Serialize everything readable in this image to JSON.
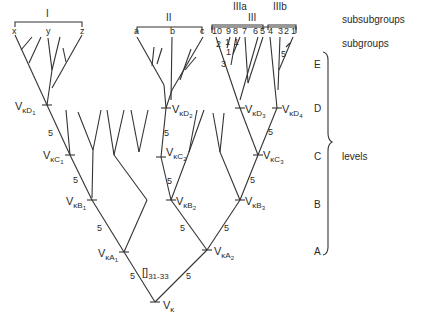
{
  "legend": {
    "subsubgroups": "subsubgroups",
    "subgroups": "subgroups",
    "levels": "levels"
  },
  "groups": {
    "I": "I",
    "II": "II",
    "III": "III",
    "IIIa": "IIIa",
    "IIIb": "IIIb"
  },
  "leaves": {
    "x": "x",
    "y": "y",
    "z": "z",
    "a": "a",
    "b": "b",
    "c": "c",
    "n10": "10",
    "n9": "9",
    "n8": "8",
    "n7": "7",
    "n6": "6",
    "n5": "5",
    "n4": "4",
    "n3": "3",
    "n2": "2",
    "n1": "1"
  },
  "level_labels": [
    "E",
    "D",
    "C",
    "B",
    "A"
  ],
  "nodes": {
    "root": {
      "main": "V",
      "sub": "κ",
      "subsub": ""
    },
    "A1": {
      "main": "V",
      "sub": "κA",
      "subsub": "1"
    },
    "A2": {
      "main": "V",
      "sub": "κA",
      "subsub": "2"
    },
    "B1": {
      "main": "V",
      "sub": "κB",
      "subsub": "1"
    },
    "B2": {
      "main": "V",
      "sub": "κB",
      "subsub": "2"
    },
    "B3": {
      "main": "V",
      "sub": "κB",
      "subsub": "3"
    },
    "C1": {
      "main": "V",
      "sub": "κC",
      "subsub": "1"
    },
    "C2": {
      "main": "V",
      "sub": "κC",
      "subsub": "2"
    },
    "C3": {
      "main": "V",
      "sub": "κC",
      "subsub": "3"
    },
    "D1": {
      "main": "V",
      "sub": "κD",
      "subsub": "1"
    },
    "D2": {
      "main": "V",
      "sub": "κD",
      "subsub": "2"
    },
    "D3": {
      "main": "V",
      "sub": "κD",
      "subsub": "3"
    },
    "D4": {
      "main": "V",
      "sub": "κD",
      "subsub": "4"
    }
  },
  "branch_numbers": {
    "five": "5",
    "three": "3",
    "two": "2",
    "one": "1"
  },
  "insertion": {
    "bracket": "[]",
    "range": "31-33"
  }
}
